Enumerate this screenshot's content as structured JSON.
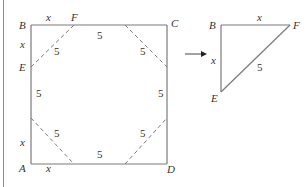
{
  "figure": {
    "type": "geometry-diagram",
    "colors": {
      "stroke": "#7a7a7a",
      "text": "#333333",
      "background": "#ffffff"
    },
    "square": {
      "vertices": {
        "A": "A",
        "B": "B",
        "C": "C",
        "D": "D",
        "E": "E",
        "F": "F"
      },
      "side_labels": {
        "bf": "x",
        "be": "x",
        "ad_left": "x",
        "ad_bottom": "x"
      },
      "octagon_side_labels": {
        "top": "5",
        "bottom": "5",
        "left": "5",
        "right": "5",
        "cut_top_left": "5",
        "cut_top_right": "5",
        "cut_bottom_left": "5",
        "cut_bottom_right": "5"
      }
    },
    "arrow": {
      "direction": "right"
    },
    "triangle": {
      "vertices": {
        "B": "B",
        "F": "F",
        "E": "E"
      },
      "side_labels": {
        "bf": "x",
        "be": "x",
        "ef": "5"
      }
    }
  }
}
